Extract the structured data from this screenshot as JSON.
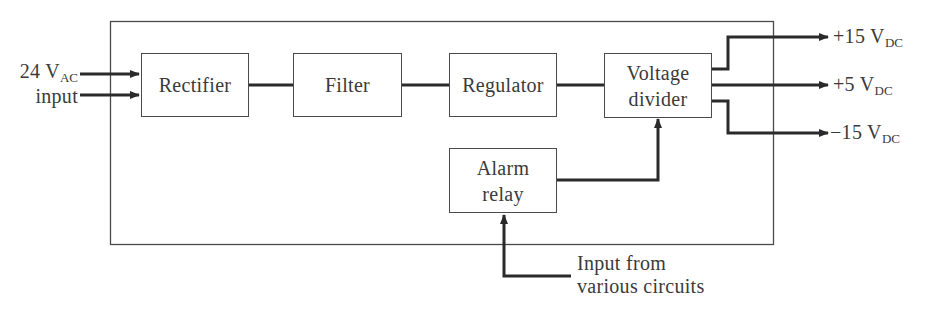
{
  "diagram": {
    "type": "block-diagram",
    "blocks": [
      {
        "id": "rectifier",
        "label": "Rectifier"
      },
      {
        "id": "filter",
        "label": "Filter"
      },
      {
        "id": "regulator",
        "label": "Regulator"
      },
      {
        "id": "voltage_divider",
        "label_line1": "Voltage",
        "label_line2": "divider"
      },
      {
        "id": "alarm_relay",
        "label_line1": "Alarm",
        "label_line2": "relay"
      }
    ],
    "input": {
      "line1_main": "24 V",
      "line1_sub": "AC",
      "line2": "input"
    },
    "outputs": [
      {
        "main": "+15 V",
        "sub": "DC"
      },
      {
        "main": "+5 V",
        "sub": "DC"
      },
      {
        "main": "−15 V",
        "sub": "DC"
      }
    ],
    "alarm_input": {
      "line1": "Input from",
      "line2": "various circuits"
    },
    "connections": [
      [
        "24 VAC input",
        "rectifier"
      ],
      [
        "rectifier",
        "filter"
      ],
      [
        "filter",
        "regulator"
      ],
      [
        "regulator",
        "voltage_divider"
      ],
      [
        "alarm_relay",
        "voltage_divider"
      ],
      [
        "Input from various circuits",
        "alarm_relay"
      ],
      [
        "voltage_divider",
        "+15 VDC"
      ],
      [
        "voltage_divider",
        "+5 VDC"
      ],
      [
        "voltage_divider",
        "-15 VDC"
      ]
    ],
    "colors": {
      "line": "#2a2a2a",
      "text": "#3a3a3a",
      "background": "#ffffff"
    }
  }
}
